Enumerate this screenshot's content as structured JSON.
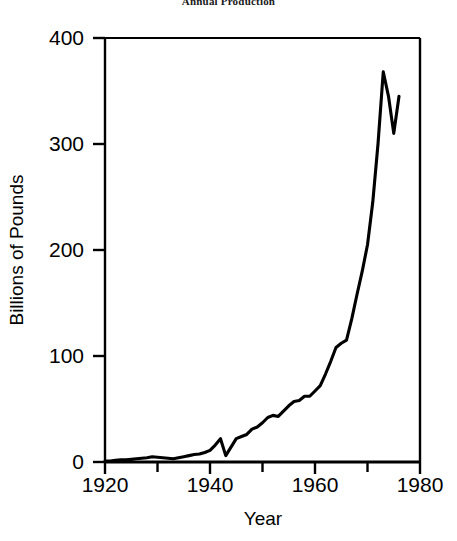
{
  "chart_data": {
    "type": "line",
    "title": "Annual Production",
    "xlabel": "Year",
    "ylabel": "Billions of Pounds",
    "xlim": [
      1920,
      1980
    ],
    "ylim": [
      0,
      400
    ],
    "xticks": [
      1920,
      1940,
      1960,
      1980
    ],
    "xtick_labels": [
      "1920",
      "1940",
      "1960",
      "1980"
    ],
    "xminor_ticks": [
      1930,
      1950,
      1970
    ],
    "yticks": [
      0,
      100,
      200,
      300,
      400
    ],
    "ytick_labels": [
      "0",
      "100",
      "200",
      "300",
      "400"
    ],
    "grid": false,
    "legend": "none",
    "line_color": "#000000",
    "series": [
      {
        "name": "Annual Production",
        "x": [
          1920,
          1921,
          1922,
          1923,
          1924,
          1925,
          1926,
          1927,
          1928,
          1929,
          1930,
          1931,
          1932,
          1933,
          1934,
          1935,
          1936,
          1937,
          1938,
          1939,
          1940,
          1941,
          1942,
          1943,
          1944,
          1945,
          1946,
          1947,
          1948,
          1949,
          1950,
          1951,
          1952,
          1953,
          1954,
          1955,
          1956,
          1957,
          1958,
          1959,
          1960,
          1961,
          1962,
          1963,
          1964,
          1965,
          1966,
          1967,
          1968,
          1969,
          1970,
          1971,
          1972,
          1973,
          1974,
          1975,
          1976
        ],
        "y": [
          1,
          1,
          1.5,
          2,
          2,
          2.5,
          3,
          3.5,
          4,
          5,
          4.5,
          4,
          3.5,
          3,
          4,
          5,
          6,
          7,
          7.5,
          9,
          11,
          16,
          22,
          6,
          14,
          22,
          24,
          26,
          31,
          33,
          37,
          42,
          44,
          43,
          48,
          53,
          57,
          58,
          62,
          62,
          67,
          72,
          83,
          95,
          108,
          112,
          115,
          135,
          158,
          180,
          205,
          245,
          300,
          368,
          345,
          310,
          345
        ]
      }
    ]
  },
  "axes": {
    "y_label": "Billions of Pounds",
    "x_label": "Year"
  }
}
